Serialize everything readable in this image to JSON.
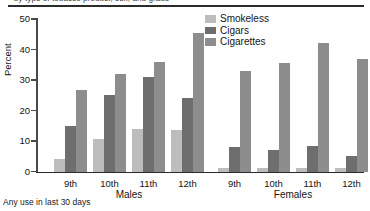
{
  "title_strip": {
    "text": "by type of tobacco product, sex, and grade",
    "rule_color": "#2b2b2b"
  },
  "footnote": "Any use in last 30 days",
  "legend": {
    "position": "top-right",
    "entries": [
      {
        "label": "Smokeless",
        "color": "#bdbdbd"
      },
      {
        "label": "Cigars",
        "color": "#6e6e6e"
      },
      {
        "label": "Cigarettes",
        "color": "#8d8d8d"
      }
    ]
  },
  "axes": {
    "ylabel": "Percent",
    "yticks": [
      "50",
      "40",
      "30",
      "20",
      "10",
      "0"
    ],
    "ymin": 0,
    "ymax": 50
  },
  "panels": [
    {
      "name": "Males",
      "label": "Males"
    },
    {
      "name": "Females",
      "label": "Females"
    }
  ],
  "grades": [
    "9th",
    "10th",
    "11th",
    "12th"
  ],
  "chart_data": {
    "type": "bar",
    "title": "by type of tobacco product, sex, and grade",
    "subtitle": "",
    "xlabel": "",
    "ylabel": "Percent",
    "ylim": [
      0,
      50
    ],
    "ytick_step": 10,
    "grid": false,
    "legend_position": "top-right",
    "annotations": [
      "Any use in last 30 days"
    ],
    "groups": [
      "Males 9th",
      "Males 10th",
      "Males 11th",
      "Males 12th",
      "Females 9th",
      "Females 10th",
      "Females 11th",
      "Females 12th"
    ],
    "panels": {
      "Males": {
        "categories": [
          "9th",
          "10th",
          "11th",
          "12th"
        ],
        "series": [
          {
            "name": "Smokeless",
            "color": "#bdbdbd",
            "values": [
              4.0,
              10.8,
              14.0,
              13.5
            ]
          },
          {
            "name": "Cigars",
            "color": "#6e6e6e",
            "values": [
              15.0,
              25.0,
              31.0,
              24.0
            ]
          },
          {
            "name": "Cigarettes",
            "color": "#8d8d8d",
            "values": [
              26.8,
              32.0,
              36.0,
              45.3
            ]
          }
        ]
      },
      "Females": {
        "categories": [
          "9th",
          "10th",
          "11th",
          "12th"
        ],
        "series": [
          {
            "name": "Smokeless",
            "color": "#bdbdbd",
            "values": [
              1.2,
              1.3,
              1.0,
              1.0
            ]
          },
          {
            "name": "Cigars",
            "color": "#6e6e6e",
            "values": [
              8.0,
              7.0,
              8.4,
              5.0
            ]
          },
          {
            "name": "Cigarettes",
            "color": "#8d8d8d",
            "values": [
              33.0,
              35.7,
              42.3,
              36.8
            ]
          }
        ]
      }
    }
  }
}
